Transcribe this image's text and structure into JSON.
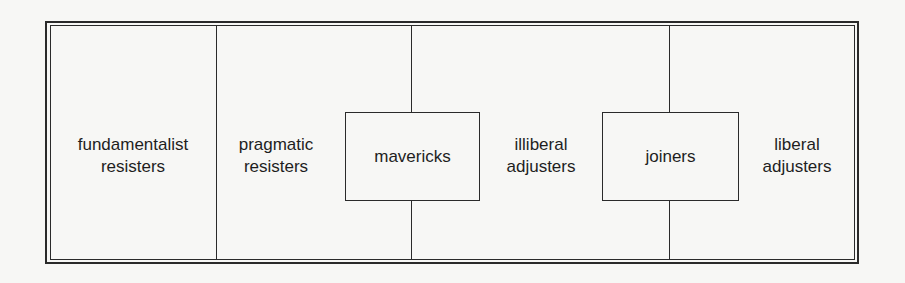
{
  "diagram": {
    "categories": [
      {
        "id": "fundamentalist-resisters",
        "label": "fundamentalist\nresisters"
      },
      {
        "id": "pragmatic-resisters",
        "label": "pragmatic\nresisters"
      },
      {
        "id": "mavericks",
        "label": "mavericks",
        "boxed": true
      },
      {
        "id": "illiberal-adjusters",
        "label": "illiberal\nadjusters"
      },
      {
        "id": "joiners",
        "label": "joiners",
        "boxed": true
      },
      {
        "id": "liberal-adjusters",
        "label": "liberal\nadjusters"
      }
    ]
  }
}
